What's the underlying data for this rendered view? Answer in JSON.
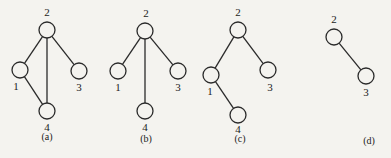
{
  "diagram": {
    "colors": {
      "background": "#f4f3ef",
      "stroke": "#2a2a2a",
      "text": "#222222"
    },
    "node_radius": 8,
    "subfigures": [
      {
        "id": "a",
        "caption": "(a)",
        "caption_pos": [
          47,
          140
        ],
        "nodes": [
          {
            "id": "2",
            "label": "2",
            "x": 47,
            "y": 30,
            "lx": 47,
            "ly": 16
          },
          {
            "id": "1",
            "label": "1",
            "x": 20,
            "y": 70,
            "lx": 16,
            "ly": 90
          },
          {
            "id": "3",
            "label": "3",
            "x": 79,
            "y": 71,
            "lx": 79,
            "ly": 91
          },
          {
            "id": "4",
            "label": "4",
            "x": 47,
            "y": 111,
            "lx": 47,
            "ly": 131
          }
        ],
        "edges": [
          [
            "2",
            "1"
          ],
          [
            "2",
            "3"
          ],
          [
            "2",
            "4"
          ],
          [
            "1",
            "4"
          ]
        ]
      },
      {
        "id": "b",
        "caption": "(b)",
        "caption_pos": [
          146,
          142
        ],
        "nodes": [
          {
            "id": "2",
            "label": "2",
            "x": 145,
            "y": 31,
            "lx": 146,
            "ly": 17
          },
          {
            "id": "1",
            "label": "1",
            "x": 118,
            "y": 71,
            "lx": 118,
            "ly": 91
          },
          {
            "id": "3",
            "label": "3",
            "x": 178,
            "y": 71,
            "lx": 178,
            "ly": 91
          },
          {
            "id": "4",
            "label": "4",
            "x": 145,
            "y": 111,
            "lx": 145,
            "ly": 131
          }
        ],
        "edges": [
          [
            "2",
            "1"
          ],
          [
            "2",
            "3"
          ],
          [
            "2",
            "4"
          ]
        ]
      },
      {
        "id": "c",
        "caption": "(c)",
        "caption_pos": [
          240,
          142
        ],
        "nodes": [
          {
            "id": "2",
            "label": "2",
            "x": 238,
            "y": 30,
            "lx": 238,
            "ly": 16
          },
          {
            "id": "1",
            "label": "1",
            "x": 211,
            "y": 75,
            "lx": 210,
            "ly": 95
          },
          {
            "id": "3",
            "label": "3",
            "x": 268,
            "y": 70,
            "lx": 270,
            "ly": 91
          },
          {
            "id": "4",
            "label": "4",
            "x": 238,
            "y": 115,
            "lx": 238,
            "ly": 133
          }
        ],
        "edges": [
          [
            "2",
            "1"
          ],
          [
            "2",
            "3"
          ],
          [
            "1",
            "4"
          ]
        ]
      },
      {
        "id": "d",
        "caption": "(d)",
        "caption_pos": [
          369,
          144
        ],
        "nodes": [
          {
            "id": "2",
            "label": "2",
            "x": 334,
            "y": 37,
            "lx": 334,
            "ly": 23
          },
          {
            "id": "3",
            "label": "3",
            "x": 366,
            "y": 76,
            "lx": 366,
            "ly": 96
          }
        ],
        "edges": [
          [
            "2",
            "3"
          ]
        ]
      }
    ]
  }
}
